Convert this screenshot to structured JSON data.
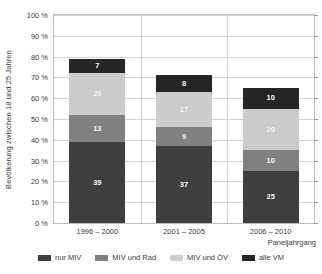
{
  "chart_data": {
    "type": "bar",
    "subtype": "stacked-column",
    "title": "",
    "xlabel": "Paneljahrgang",
    "ylabel": "Bevölkerung zwischen 18 und 25 Jahren",
    "categories": [
      "1996 – 2000",
      "2001 – 2005",
      "2006 – 2010"
    ],
    "series": [
      {
        "name": "nur MIV",
        "color": "#3f3f3f",
        "values": [
          39,
          37,
          25
        ]
      },
      {
        "name": "MIV und Rad",
        "color": "#808080",
        "values": [
          13,
          9,
          10
        ]
      },
      {
        "name": "MIV und ÖV",
        "color": "#cccccc",
        "values": [
          20,
          17,
          20
        ]
      },
      {
        "name": "alle VM",
        "color": "#262626",
        "values": [
          7,
          8,
          10
        ]
      }
    ],
    "totals": [
      79,
      71,
      65
    ],
    "ylim": [
      0,
      100
    ],
    "yticks": [
      0,
      10,
      20,
      30,
      40,
      50,
      60,
      70,
      80,
      90,
      100
    ],
    "ytick_labels": [
      "0 %",
      "10 %",
      "20 %",
      "30 %",
      "40 %",
      "50 %",
      "60 %",
      "70 %",
      "80 %",
      "90 %",
      "100 %"
    ],
    "grid": true,
    "legend_position": "bottom",
    "value_labels": true
  },
  "legend": {
    "items": [
      {
        "label": "nur MIV",
        "color": "#3f3f3f"
      },
      {
        "label": "MIV und Rad",
        "color": "#808080"
      },
      {
        "label": "MIV und ÖV",
        "color": "#cccccc"
      },
      {
        "label": "alle VM",
        "color": "#262626"
      }
    ]
  }
}
